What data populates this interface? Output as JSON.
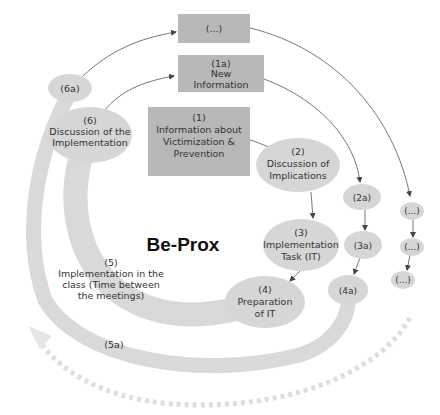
{
  "diagram": {
    "title": "Be-Prox",
    "colors": {
      "box_fill": "#b8b8b8",
      "ellipse_fill": "#d6d6d6",
      "band": "#d9d9d9",
      "dotted_arrow": "#dedede",
      "connector": "#555555"
    },
    "boxes": {
      "ellipsis_top": {
        "lines": [
          "(...)"
        ]
      },
      "b1a": {
        "lines": [
          "(1a)",
          "New",
          "Information"
        ]
      },
      "b1": {
        "lines": [
          "(1)",
          "Information about",
          "Victimization &",
          "Prevention"
        ]
      }
    },
    "nodes": {
      "n2": {
        "lines": [
          "(2)",
          "Discussion of",
          "Implications"
        ]
      },
      "n3": {
        "lines": [
          "(3)",
          "Implementation",
          "Task (IT)"
        ]
      },
      "n4": {
        "lines": [
          "(4)",
          "Preparation",
          "of IT"
        ]
      },
      "n5": {
        "lines": [
          "(5)",
          "Implementation in the",
          "class (Time between",
          "the meetings)"
        ]
      },
      "n6": {
        "lines": [
          "(6)",
          "Discussion of the",
          "Implementation"
        ]
      },
      "n2a": {
        "lines": [
          "(2a)"
        ]
      },
      "n3a": {
        "lines": [
          "(3a)"
        ]
      },
      "n4a": {
        "lines": [
          "(4a)"
        ]
      },
      "n5a": {
        "lines": [
          "(5a)"
        ]
      },
      "n6a": {
        "lines": [
          "(6a)"
        ]
      },
      "e1": {
        "lines": [
          "(...)"
        ]
      },
      "e2": {
        "lines": [
          "(...)"
        ]
      },
      "e3": {
        "lines": [
          "(...)"
        ]
      }
    }
  }
}
